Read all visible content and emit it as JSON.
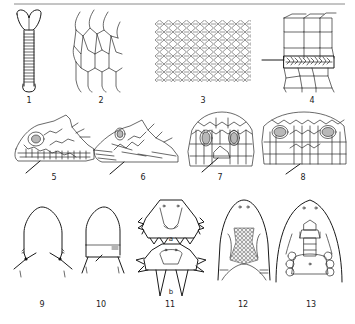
{
  "plate": {
    "top_rule": {
      "x1": 14,
      "x2": 345,
      "y": 4,
      "color": "#8a8a8a"
    },
    "ink_color": "#2a2a2a",
    "figures": [
      {
        "id": "1",
        "label": "1",
        "subject": "tail-ventral-view"
      },
      {
        "id": "2",
        "label": "2",
        "subject": "large-hexagonal-scales"
      },
      {
        "id": "3",
        "label": "3",
        "subject": "small-keeled-scales"
      },
      {
        "id": "4",
        "label": "4",
        "subject": "scale-rows-with-granular-band"
      },
      {
        "id": "5",
        "label": "5",
        "subject": "head-lateral-view"
      },
      {
        "id": "6",
        "label": "6",
        "subject": "head-lateral-view-keeled"
      },
      {
        "id": "7",
        "label": "7",
        "subject": "head-frontal-scales"
      },
      {
        "id": "8",
        "label": "8",
        "subject": "head-frontal-scales-wide"
      },
      {
        "id": "9",
        "label": "9",
        "subject": "head-outline-dorsal"
      },
      {
        "id": "10",
        "label": "10",
        "subject": "head-outline-dorsal-with-collar"
      },
      {
        "id": "11",
        "label": "11",
        "subject": "spiny-heads-a-b",
        "sublabels": [
          "a",
          "b"
        ]
      },
      {
        "id": "12",
        "label": "12",
        "subject": "head-ventral-granular-patch"
      },
      {
        "id": "13",
        "label": "13",
        "subject": "head-ventral-plates"
      }
    ]
  }
}
